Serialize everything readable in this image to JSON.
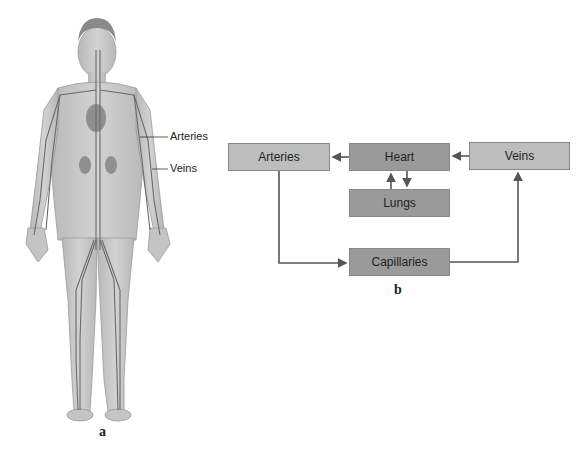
{
  "panel_a": {
    "label": "a",
    "callouts": [
      {
        "text": "Arteries"
      },
      {
        "text": "Veins"
      }
    ]
  },
  "panel_b": {
    "label": "b",
    "nodes": {
      "arteries": "Arteries",
      "heart": "Heart",
      "veins": "Veins",
      "lungs": "Lungs",
      "capillaries": "Capillaries"
    },
    "edges": [
      {
        "from": "Heart",
        "to": "Arteries"
      },
      {
        "from": "Veins",
        "to": "Heart"
      },
      {
        "from": "Heart",
        "to": "Lungs"
      },
      {
        "from": "Lungs",
        "to": "Heart"
      },
      {
        "from": "Arteries",
        "to": "Capillaries"
      },
      {
        "from": "Capillaries",
        "to": "Veins"
      }
    ]
  },
  "colors": {
    "box_light": "#bdbdbd",
    "box_dark": "#9a9a9a",
    "line": "#555555"
  }
}
